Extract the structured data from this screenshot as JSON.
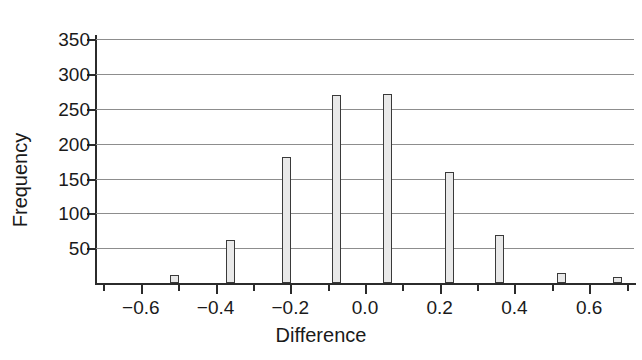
{
  "chart_data": {
    "type": "bar",
    "title": "",
    "subtitle": "",
    "xlabel": "Difference",
    "ylabel": "Frequency",
    "xlim": [
      -0.72,
      0.72
    ],
    "ylim": [
      0,
      355
    ],
    "grid": true,
    "legend": false,
    "legend_position": "none",
    "bar_fill_color": "#e9e9e9",
    "bar_edge_color": "#3a3a3a",
    "gridline_color": "#8d8d8d",
    "axis_color": "#2b2b2b",
    "bin_width": 0.015,
    "x_tick_labels": [
      "−0.6",
      "−0.4",
      "−0.2",
      "0.0",
      "0.2",
      "0.4",
      "0.6"
    ],
    "x_tick_values": [
      -0.6,
      -0.4,
      -0.2,
      0.0,
      0.2,
      0.4,
      0.6
    ],
    "x_minor_tick_values": [
      -0.7,
      -0.5,
      -0.3,
      -0.1,
      0.1,
      0.3,
      0.5,
      0.7
    ],
    "y_tick_labels": [
      "50",
      "100",
      "150",
      "200",
      "250",
      "300",
      "350"
    ],
    "y_tick_values": [
      50,
      100,
      150,
      200,
      250,
      300,
      350
    ],
    "x": [
      -0.51,
      -0.36,
      -0.21,
      -0.075,
      0.06,
      0.225,
      0.36,
      0.525,
      0.675
    ],
    "values": [
      11,
      62,
      181,
      270,
      272,
      160,
      69,
      14,
      9
    ],
    "bars": [
      {
        "x": -0.51,
        "value": 11,
        "label": "bar-neg-0-51"
      },
      {
        "x": -0.36,
        "value": 62,
        "label": "bar-neg-0-36"
      },
      {
        "x": -0.21,
        "value": 181,
        "label": "bar-neg-0-21"
      },
      {
        "x": -0.075,
        "value": 270,
        "label": "bar-neg-0-075"
      },
      {
        "x": 0.06,
        "value": 272,
        "label": "bar-pos-0-06"
      },
      {
        "x": 0.225,
        "value": 160,
        "label": "bar-pos-0-225"
      },
      {
        "x": 0.36,
        "value": 69,
        "label": "bar-pos-0-36"
      },
      {
        "x": 0.525,
        "value": 14,
        "label": "bar-pos-0-525"
      },
      {
        "x": 0.675,
        "value": 9,
        "label": "bar-pos-0-675"
      }
    ]
  }
}
